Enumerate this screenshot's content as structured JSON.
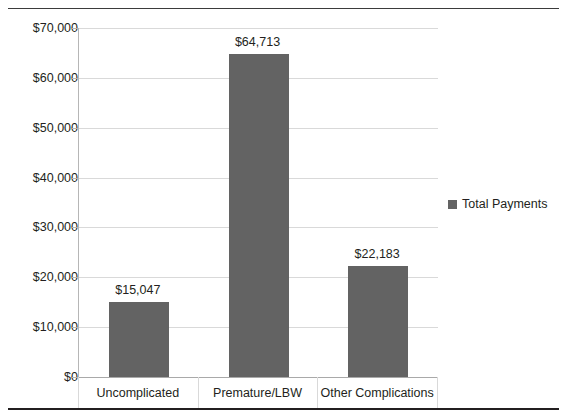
{
  "chart_data": {
    "type": "bar",
    "title": "",
    "xlabel": "",
    "ylabel": "",
    "categories": [
      "Uncomplicated",
      "Premature/LBW",
      "Other Complications"
    ],
    "values": [
      15047,
      64713,
      22183
    ],
    "value_labels": [
      "$15,047",
      "$64,713",
      "$22,183"
    ],
    "series": [
      {
        "name": "Total Payments",
        "values": [
          15047,
          64713,
          22183
        ],
        "color": "#636363"
      }
    ],
    "ylim": [
      0,
      70000
    ],
    "ytick_values": [
      0,
      10000,
      20000,
      30000,
      40000,
      50000,
      60000,
      70000
    ],
    "ytick_labels": [
      "$0",
      "$10,000",
      "$20,000",
      "$30,000",
      "$40,000",
      "$50,000",
      "$60,000",
      "$70,000"
    ],
    "grid": true,
    "legend_position": "right"
  },
  "legend": {
    "entries": [
      {
        "label": "Total Payments",
        "color": "#636363"
      }
    ]
  },
  "colors": {
    "bar": "#636363",
    "gridline": "#d9d9d9",
    "axis": "#b6b6b6",
    "text": "#231f20",
    "rule": "#231f20"
  }
}
